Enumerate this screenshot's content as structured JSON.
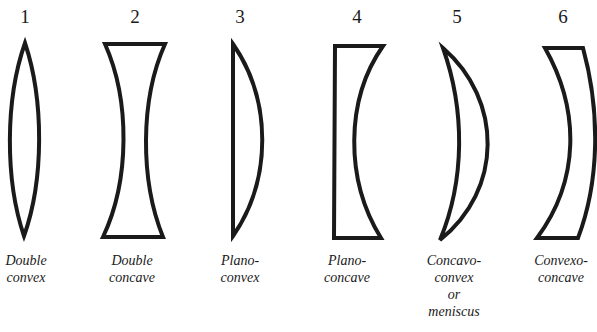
{
  "lenses": [
    {
      "number": "1",
      "name_line1": "Double",
      "name_line2": "convex",
      "name_line3": "",
      "name_line4": ""
    },
    {
      "number": "2",
      "name_line1": "Double",
      "name_line2": "concave",
      "name_line3": "",
      "name_line4": ""
    },
    {
      "number": "3",
      "name_line1": "Plano-",
      "name_line2": "convex",
      "name_line3": "",
      "name_line4": ""
    },
    {
      "number": "4",
      "name_line1": "Plano-",
      "name_line2": "concave",
      "name_line3": "",
      "name_line4": ""
    },
    {
      "number": "5",
      "name_line1": "Concavo-",
      "name_line2": "convex",
      "name_line3": "or",
      "name_line4": "meniscus"
    },
    {
      "number": "6",
      "name_line1": "Convexo-",
      "name_line2": "concave",
      "name_line3": "",
      "name_line4": ""
    }
  ],
  "colors": {
    "stroke": "#1a1a1a",
    "background": "#ffffff"
  }
}
